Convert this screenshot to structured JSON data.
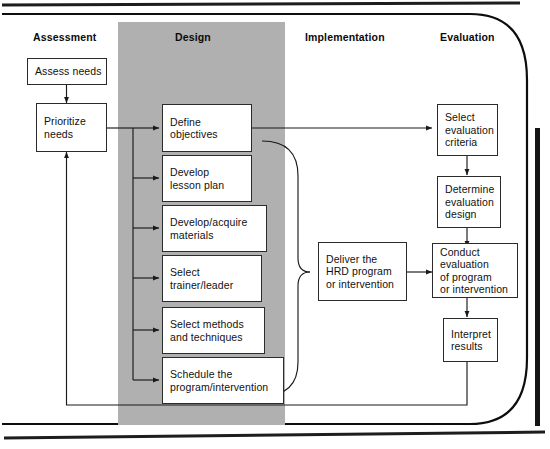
{
  "diagram": {
    "type": "flowchart",
    "phases": [
      {
        "id": "assessment",
        "label": "Assessment"
      },
      {
        "id": "design",
        "label": "Design"
      },
      {
        "id": "implementation",
        "label": "Implementation"
      },
      {
        "id": "evaluation",
        "label": "Evaluation"
      }
    ],
    "colors": {
      "band_fill": "#b0b0b0",
      "box_fill": "#ffffff",
      "box_stroke": "#2b2b2b",
      "connector": "#1a1a1a",
      "frame": "#0d0d0d",
      "text": "#111111"
    },
    "nodes": [
      {
        "id": "assess-needs",
        "phase": "assessment",
        "lines": [
          "Assess needs"
        ]
      },
      {
        "id": "prioritize-needs",
        "phase": "assessment",
        "lines": [
          "Prioritize",
          "needs"
        ]
      },
      {
        "id": "define-objectives",
        "phase": "design",
        "lines": [
          "Define",
          "objectives"
        ]
      },
      {
        "id": "develop-lesson-plan",
        "phase": "design",
        "lines": [
          "Develop",
          "lesson plan"
        ]
      },
      {
        "id": "develop-materials",
        "phase": "design",
        "lines": [
          "Develop/acquire",
          "materials"
        ]
      },
      {
        "id": "select-trainer",
        "phase": "design",
        "lines": [
          "Select",
          "trainer/leader"
        ]
      },
      {
        "id": "select-methods",
        "phase": "design",
        "lines": [
          "Select methods",
          "and techniques"
        ]
      },
      {
        "id": "schedule-program",
        "phase": "design",
        "lines": [
          "Schedule the",
          "program/intervention"
        ]
      },
      {
        "id": "deliver-program",
        "phase": "implementation",
        "lines": [
          "Deliver the",
          "HRD program",
          "or intervention"
        ]
      },
      {
        "id": "select-criteria",
        "phase": "evaluation",
        "lines": [
          "Select",
          "evaluation",
          "criteria"
        ]
      },
      {
        "id": "determine-design",
        "phase": "evaluation",
        "lines": [
          "Determine",
          "evaluation",
          "design"
        ]
      },
      {
        "id": "conduct-evaluation",
        "phase": "evaluation",
        "lines": [
          "Conduct",
          "evaluation",
          "of program",
          "or intervention"
        ]
      },
      {
        "id": "interpret-results",
        "phase": "evaluation",
        "lines": [
          "Interpret",
          "results"
        ]
      }
    ],
    "edges": [
      {
        "from": "assess-needs",
        "to": "prioritize-needs"
      },
      {
        "from": "prioritize-needs",
        "to": "design-spine"
      },
      {
        "from": "design-spine",
        "to": "define-objectives"
      },
      {
        "from": "design-spine",
        "to": "develop-lesson-plan"
      },
      {
        "from": "design-spine",
        "to": "develop-materials"
      },
      {
        "from": "design-spine",
        "to": "select-trainer"
      },
      {
        "from": "design-spine",
        "to": "select-methods"
      },
      {
        "from": "design-spine",
        "to": "schedule-program"
      },
      {
        "from": "define-objectives",
        "to": "select-criteria"
      },
      {
        "from": "design-brace",
        "to": "deliver-program"
      },
      {
        "from": "deliver-program",
        "to": "conduct-evaluation"
      },
      {
        "from": "select-criteria",
        "to": "determine-design"
      },
      {
        "from": "determine-design",
        "to": "conduct-evaluation"
      },
      {
        "from": "conduct-evaluation",
        "to": "interpret-results"
      },
      {
        "from": "interpret-results",
        "to": "prioritize-needs",
        "kind": "feedback"
      }
    ]
  }
}
